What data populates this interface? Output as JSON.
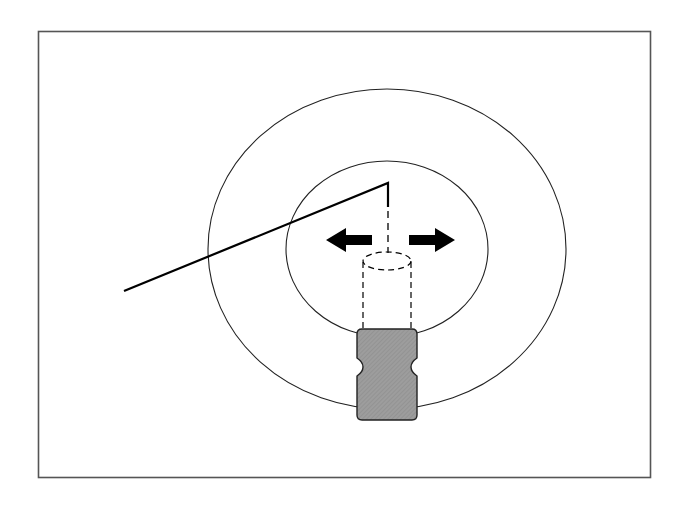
{
  "diagram": {
    "type": "schematic",
    "elements": [
      {
        "name": "frame",
        "description": "rectangular border frame"
      },
      {
        "name": "outer-circle",
        "description": "large outer circle"
      },
      {
        "name": "inner-circle",
        "description": "smaller inner circle"
      },
      {
        "name": "bent-wire",
        "description": "solid line from left rising to apex, then dropping vertically"
      },
      {
        "name": "hidden-shaft",
        "description": "dashed vertical line and dashed cylinder (hidden lines)"
      },
      {
        "name": "left-arrow",
        "description": "bold arrow pointing left"
      },
      {
        "name": "right-arrow",
        "description": "bold arrow pointing right"
      },
      {
        "name": "clamp-block",
        "description": "grey hatched block with side notches at base of cylinder"
      }
    ],
    "colors": {
      "stroke": "#111111",
      "frame": "#555555",
      "block_fill": "#9a9a9a",
      "background": "#ffffff"
    }
  }
}
